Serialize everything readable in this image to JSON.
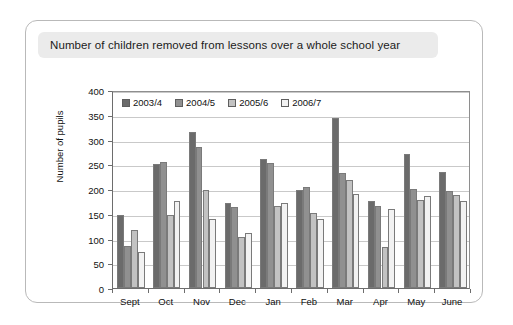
{
  "figure": {
    "title": "Number of children removed from lessons over a whole school year"
  },
  "chart_data": {
    "type": "bar",
    "title": "Number of children removed from lessons over a whole school year",
    "xlabel": "",
    "ylabel": "Number of pupils",
    "ylim": [
      0,
      400
    ],
    "ytick_step": 50,
    "yticks": [
      "0",
      "50",
      "100",
      "150",
      "200",
      "250",
      "300",
      "350",
      "400"
    ],
    "grid": true,
    "legend_position": "top-left inside plot",
    "categories": [
      "Sept",
      "Oct",
      "Nov",
      "Dec",
      "Jan",
      "Feb",
      "Mar",
      "Apr",
      "May",
      "June"
    ],
    "series": [
      {
        "name": "2003/4",
        "color": "#6b6b6b",
        "values": [
          148,
          250,
          315,
          172,
          260,
          198,
          343,
          175,
          270,
          235
        ]
      },
      {
        "name": "2004/5",
        "color": "#909090",
        "values": [
          85,
          255,
          285,
          163,
          252,
          205,
          232,
          165,
          200,
          195
        ]
      },
      {
        "name": "2005/6",
        "color": "#c2c2c2",
        "values": [
          118,
          148,
          198,
          103,
          165,
          152,
          218,
          82,
          178,
          188
        ]
      },
      {
        "name": "2006/7",
        "color": "#f2f2f2",
        "values": [
          73,
          175,
          140,
          112,
          172,
          140,
          190,
          160,
          185,
          175
        ]
      }
    ]
  }
}
